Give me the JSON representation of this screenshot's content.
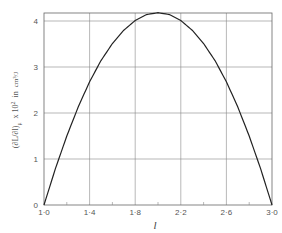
{
  "chart_data": {
    "type": "line",
    "title": "",
    "xlabel": "l",
    "ylabel": "(∂L/∂l)μ × 10² in cm³/J",
    "ylabel_parts": {
      "derivative": "(∂L/∂l)",
      "subscript": "μ",
      "multiplier": "x 10",
      "exponent": "2",
      "unit_prefix": "in",
      "unit_num": "cm³",
      "unit_den": "J"
    },
    "xlim": [
      1.0,
      3.0
    ],
    "ylim": [
      0,
      4.2
    ],
    "xticks": [
      1.0,
      1.4,
      1.8,
      2.2,
      2.6,
      3.0
    ],
    "xtick_labels": [
      "1·0",
      "1·4",
      "1·8",
      "2·2",
      "2·6",
      "3·0"
    ],
    "yticks": [
      0,
      1,
      2,
      3,
      4
    ],
    "ytick_labels": [
      "0",
      "1",
      "2",
      "3",
      "4"
    ],
    "grid": true,
    "legend": null,
    "series": [
      {
        "name": "curve",
        "x": [
          1.0,
          1.1,
          1.2,
          1.3,
          1.4,
          1.5,
          1.6,
          1.7,
          1.8,
          1.9,
          2.0,
          2.1,
          2.2,
          2.3,
          2.4,
          2.5,
          2.6,
          2.7,
          2.8,
          2.9,
          3.0
        ],
        "y": [
          0,
          0.79,
          1.5,
          2.13,
          2.68,
          3.14,
          3.51,
          3.8,
          4.01,
          4.14,
          4.18,
          4.14,
          4.01,
          3.8,
          3.51,
          3.14,
          2.68,
          2.13,
          1.5,
          0.79,
          0
        ]
      }
    ]
  }
}
